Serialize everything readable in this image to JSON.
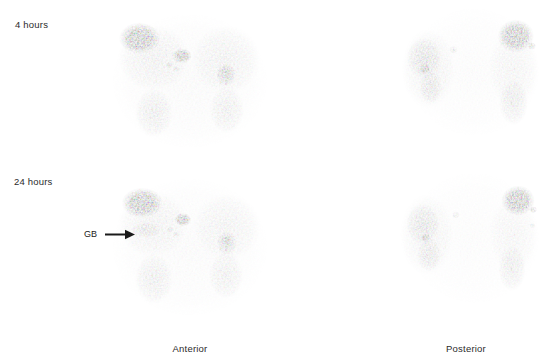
{
  "figure": {
    "type": "nuclear-medicine-scintigraphy",
    "modality": "planar gamma camera scintigraphy",
    "background_color": "#ffffff",
    "ink_color": "#1a1a1a",
    "width": 552,
    "height": 364
  },
  "row_labels": {
    "early": "4 hours",
    "late": "24 hours"
  },
  "column_labels": {
    "left": "Anterior",
    "right": "Posterior"
  },
  "annotations": [
    {
      "id": "gallbladder",
      "text": "GB",
      "marker": "arrow-right-icon",
      "panel": "anterior-24-hours",
      "points_to": "gallbladder uptake focus"
    }
  ],
  "panels": [
    {
      "id": "anterior-4-hours",
      "row": "4 hours",
      "view": "Anterior",
      "x": 100,
      "y": 8,
      "w": 180,
      "h": 152
    },
    {
      "id": "posterior-4-hours",
      "row": "4 hours",
      "view": "Posterior",
      "x": 398,
      "y": 8,
      "w": 152,
      "h": 152
    },
    {
      "id": "anterior-24-hours",
      "row": "24 hours",
      "view": "Anterior",
      "x": 100,
      "y": 174,
      "w": 180,
      "h": 152
    },
    {
      "id": "posterior-24-hours",
      "row": "24 hours",
      "view": "Posterior",
      "x": 398,
      "y": 174,
      "w": 152,
      "h": 152
    }
  ],
  "chart_data": {
    "type": "heatmap",
    "title": "",
    "colormap": "grayscale-inverted",
    "intensity_scale": {
      "min": 0,
      "max": 100,
      "note": "0 = white (no counts), 100 = black (maximum counts)"
    },
    "panels": [
      {
        "id": "anterior-4-hours",
        "label": "4 hours / Anterior",
        "regions": [
          {
            "name": "focal-hot-spot-upper-left",
            "cx": 0.22,
            "cy": 0.2,
            "rx": 0.115,
            "ry": 0.105,
            "intensity": 100
          },
          {
            "name": "focal-hot-spot-midline",
            "cx": 0.455,
            "cy": 0.315,
            "rx": 0.055,
            "ry": 0.05,
            "intensity": 98
          },
          {
            "name": "small-focus-a",
            "cx": 0.385,
            "cy": 0.375,
            "rx": 0.022,
            "ry": 0.02,
            "intensity": 55
          },
          {
            "name": "small-focus-b",
            "cx": 0.425,
            "cy": 0.4,
            "rx": 0.02,
            "ry": 0.018,
            "intensity": 48
          },
          {
            "name": "right-flank-uptake",
            "cx": 0.7,
            "cy": 0.44,
            "rx": 0.055,
            "ry": 0.075,
            "intensity": 82
          },
          {
            "name": "right-flank-focus",
            "cx": 0.695,
            "cy": 0.415,
            "rx": 0.025,
            "ry": 0.025,
            "intensity": 92
          },
          {
            "name": "left-soft-tissue-body",
            "cx": 0.3,
            "cy": 0.33,
            "rx": 0.2,
            "ry": 0.215,
            "intensity": 30
          },
          {
            "name": "right-soft-tissue-body",
            "cx": 0.7,
            "cy": 0.34,
            "rx": 0.19,
            "ry": 0.225,
            "intensity": 28
          },
          {
            "name": "left-lower-organ",
            "cx": 0.3,
            "cy": 0.69,
            "rx": 0.105,
            "ry": 0.16,
            "intensity": 38
          },
          {
            "name": "right-lower-organ",
            "cx": 0.705,
            "cy": 0.67,
            "rx": 0.095,
            "ry": 0.155,
            "intensity": 34
          },
          {
            "name": "diffuse-background",
            "cx": 0.5,
            "cy": 0.48,
            "rx": 0.43,
            "ry": 0.44,
            "intensity": 14
          }
        ]
      },
      {
        "id": "posterior-4-hours",
        "label": "4 hours / Posterior",
        "mirrored": true,
        "regions": [
          {
            "name": "focal-hot-spot-upper-right",
            "cx": 0.775,
            "cy": 0.185,
            "rx": 0.12,
            "ry": 0.11,
            "intensity": 100
          },
          {
            "name": "satellite-focus",
            "cx": 0.88,
            "cy": 0.25,
            "rx": 0.028,
            "ry": 0.025,
            "intensity": 70
          },
          {
            "name": "left-kidney-upper",
            "cx": 0.175,
            "cy": 0.33,
            "rx": 0.115,
            "ry": 0.135,
            "intensity": 52
          },
          {
            "name": "left-kidney-focus",
            "cx": 0.175,
            "cy": 0.4,
            "rx": 0.038,
            "ry": 0.034,
            "intensity": 92
          },
          {
            "name": "left-kidney-lower",
            "cx": 0.215,
            "cy": 0.52,
            "rx": 0.075,
            "ry": 0.11,
            "intensity": 46
          },
          {
            "name": "midline-small-focus",
            "cx": 0.365,
            "cy": 0.275,
            "rx": 0.028,
            "ry": 0.026,
            "intensity": 42
          },
          {
            "name": "right-lower-organ",
            "cx": 0.76,
            "cy": 0.62,
            "rx": 0.095,
            "ry": 0.15,
            "intensity": 40
          },
          {
            "name": "left-body-field",
            "cx": 0.2,
            "cy": 0.4,
            "rx": 0.175,
            "ry": 0.26,
            "intensity": 26
          },
          {
            "name": "right-body-field",
            "cx": 0.76,
            "cy": 0.4,
            "rx": 0.165,
            "ry": 0.255,
            "intensity": 22
          },
          {
            "name": "diffuse-background",
            "cx": 0.5,
            "cy": 0.42,
            "rx": 0.43,
            "ry": 0.42,
            "intensity": 10
          }
        ]
      },
      {
        "id": "anterior-24-hours",
        "label": "24 hours / Anterior",
        "regions": [
          {
            "name": "focal-hot-spot-upper-left",
            "cx": 0.235,
            "cy": 0.19,
            "rx": 0.115,
            "ry": 0.1,
            "intensity": 100
          },
          {
            "name": "focal-hot-spot-midline",
            "cx": 0.46,
            "cy": 0.3,
            "rx": 0.048,
            "ry": 0.044,
            "intensity": 98
          },
          {
            "name": "gallbladder",
            "cx": 0.255,
            "cy": 0.37,
            "rx": 0.08,
            "ry": 0.05,
            "intensity": 44
          },
          {
            "name": "small-focus-a",
            "cx": 0.39,
            "cy": 0.365,
            "rx": 0.02,
            "ry": 0.018,
            "intensity": 50
          },
          {
            "name": "small-focus-b",
            "cx": 0.425,
            "cy": 0.395,
            "rx": 0.02,
            "ry": 0.018,
            "intensity": 45
          },
          {
            "name": "right-flank-focus",
            "cx": 0.7,
            "cy": 0.43,
            "rx": 0.027,
            "ry": 0.026,
            "intensity": 95
          },
          {
            "name": "right-flank-uptake",
            "cx": 0.705,
            "cy": 0.455,
            "rx": 0.055,
            "ry": 0.075,
            "intensity": 72
          },
          {
            "name": "left-soft-tissue-body",
            "cx": 0.295,
            "cy": 0.33,
            "rx": 0.195,
            "ry": 0.215,
            "intensity": 27
          },
          {
            "name": "right-soft-tissue-body",
            "cx": 0.705,
            "cy": 0.35,
            "rx": 0.185,
            "ry": 0.22,
            "intensity": 25
          },
          {
            "name": "left-lower-organ",
            "cx": 0.3,
            "cy": 0.69,
            "rx": 0.105,
            "ry": 0.165,
            "intensity": 36
          },
          {
            "name": "right-lower-organ",
            "cx": 0.7,
            "cy": 0.665,
            "rx": 0.095,
            "ry": 0.155,
            "intensity": 32
          },
          {
            "name": "diffuse-background",
            "cx": 0.5,
            "cy": 0.48,
            "rx": 0.43,
            "ry": 0.45,
            "intensity": 13
          }
        ]
      },
      {
        "id": "posterior-24-hours",
        "label": "24 hours / Posterior",
        "mirrored": true,
        "regions": [
          {
            "name": "focal-hot-spot-upper-right",
            "cx": 0.79,
            "cy": 0.175,
            "rx": 0.11,
            "ry": 0.1,
            "intensity": 100
          },
          {
            "name": "satellite-focus",
            "cx": 0.89,
            "cy": 0.235,
            "rx": 0.025,
            "ry": 0.022,
            "intensity": 78
          },
          {
            "name": "small-focus-right",
            "cx": 0.885,
            "cy": 0.34,
            "rx": 0.02,
            "ry": 0.018,
            "intensity": 40
          },
          {
            "name": "left-kidney-upper",
            "cx": 0.165,
            "cy": 0.33,
            "rx": 0.11,
            "ry": 0.135,
            "intensity": 48
          },
          {
            "name": "left-kidney-focus",
            "cx": 0.18,
            "cy": 0.42,
            "rx": 0.03,
            "ry": 0.028,
            "intensity": 90
          },
          {
            "name": "left-kidney-lower",
            "cx": 0.205,
            "cy": 0.53,
            "rx": 0.08,
            "ry": 0.11,
            "intensity": 42
          },
          {
            "name": "midline-small-focus",
            "cx": 0.38,
            "cy": 0.27,
            "rx": 0.026,
            "ry": 0.024,
            "intensity": 38
          },
          {
            "name": "right-lower-organ",
            "cx": 0.75,
            "cy": 0.62,
            "rx": 0.09,
            "ry": 0.15,
            "intensity": 38
          },
          {
            "name": "left-body-field",
            "cx": 0.19,
            "cy": 0.4,
            "rx": 0.175,
            "ry": 0.265,
            "intensity": 24
          },
          {
            "name": "right-body-field",
            "cx": 0.76,
            "cy": 0.4,
            "rx": 0.16,
            "ry": 0.25,
            "intensity": 20
          },
          {
            "name": "diffuse-background",
            "cx": 0.5,
            "cy": 0.42,
            "rx": 0.43,
            "ry": 0.43,
            "intensity": 9
          }
        ]
      }
    ]
  }
}
